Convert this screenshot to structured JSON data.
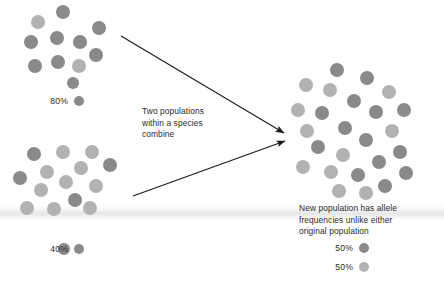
{
  "diagram": {
    "title": "Two populations within a species combine",
    "center_text": "Two populations\nwithin a species\ncombine",
    "result_text": "New population has allele\nfrequencies unlike either\noriginal population",
    "colors": {
      "dark_allele": "#8a8a8a",
      "light_allele": "#b2b2b2",
      "text": "#2b2b2b",
      "arrow": "#1a1a1a",
      "background": "#ffffff"
    },
    "populations": [
      {
        "id": "population-one",
        "legend": {
          "percent": "80%",
          "swatch": "dark"
        },
        "dots": [
          {
            "x": 38,
            "y": 22,
            "r": 7,
            "shade": "light"
          },
          {
            "x": 63,
            "y": 12,
            "r": 7,
            "shade": "dark"
          },
          {
            "x": 31,
            "y": 42,
            "r": 7,
            "shade": "dark"
          },
          {
            "x": 57,
            "y": 38,
            "r": 7,
            "shade": "dark"
          },
          {
            "x": 80,
            "y": 42,
            "r": 7,
            "shade": "dark"
          },
          {
            "x": 99,
            "y": 28,
            "r": 7,
            "shade": "dark"
          },
          {
            "x": 96,
            "y": 55,
            "r": 7,
            "shade": "dark"
          },
          {
            "x": 35,
            "y": 66,
            "r": 7,
            "shade": "dark"
          },
          {
            "x": 58,
            "y": 62,
            "r": 7,
            "shade": "dark"
          },
          {
            "x": 79,
            "y": 66,
            "r": 7,
            "shade": "light"
          },
          {
            "x": 73,
            "y": 83,
            "r": 6,
            "shade": "dark"
          }
        ]
      },
      {
        "id": "population-two",
        "legend": {
          "percent": "40%",
          "swatch": "dark"
        },
        "dots": [
          {
            "x": 34,
            "y": 154,
            "r": 7,
            "shade": "dark"
          },
          {
            "x": 63,
            "y": 152,
            "r": 7,
            "shade": "light"
          },
          {
            "x": 92,
            "y": 152,
            "r": 7,
            "shade": "light"
          },
          {
            "x": 47,
            "y": 172,
            "r": 7,
            "shade": "light"
          },
          {
            "x": 81,
            "y": 168,
            "r": 7,
            "shade": "light"
          },
          {
            "x": 110,
            "y": 165,
            "r": 7,
            "shade": "dark"
          },
          {
            "x": 20,
            "y": 178,
            "r": 7,
            "shade": "dark"
          },
          {
            "x": 66,
            "y": 182,
            "r": 7,
            "shade": "light"
          },
          {
            "x": 41,
            "y": 190,
            "r": 7,
            "shade": "light"
          },
          {
            "x": 96,
            "y": 186,
            "r": 7,
            "shade": "light"
          },
          {
            "x": 75,
            "y": 200,
            "r": 7,
            "shade": "dark"
          },
          {
            "x": 27,
            "y": 208,
            "r": 7,
            "shade": "light"
          },
          {
            "x": 54,
            "y": 209,
            "r": 7,
            "shade": "light"
          },
          {
            "x": 90,
            "y": 208,
            "r": 7,
            "shade": "light"
          },
          {
            "x": 64,
            "y": 249,
            "r": 6,
            "shade": "dark"
          }
        ]
      }
    ],
    "result_population": {
      "id": "merged-population",
      "legend": [
        {
          "percent": "50%",
          "swatch": "dark"
        },
        {
          "percent": "50%",
          "swatch": "light"
        }
      ],
      "dots": [
        {
          "x": 337,
          "y": 70,
          "r": 7,
          "shade": "dark"
        },
        {
          "x": 306,
          "y": 85,
          "r": 7,
          "shade": "light"
        },
        {
          "x": 330,
          "y": 90,
          "r": 7,
          "shade": "light"
        },
        {
          "x": 367,
          "y": 78,
          "r": 7,
          "shade": "dark"
        },
        {
          "x": 389,
          "y": 92,
          "r": 7,
          "shade": "light"
        },
        {
          "x": 354,
          "y": 101,
          "r": 7,
          "shade": "dark"
        },
        {
          "x": 298,
          "y": 110,
          "r": 7,
          "shade": "light"
        },
        {
          "x": 322,
          "y": 113,
          "r": 7,
          "shade": "dark"
        },
        {
          "x": 376,
          "y": 112,
          "r": 7,
          "shade": "dark"
        },
        {
          "x": 404,
          "y": 110,
          "r": 7,
          "shade": "dark"
        },
        {
          "x": 345,
          "y": 128,
          "r": 7,
          "shade": "dark"
        },
        {
          "x": 307,
          "y": 131,
          "r": 7,
          "shade": "light"
        },
        {
          "x": 392,
          "y": 131,
          "r": 7,
          "shade": "light"
        },
        {
          "x": 366,
          "y": 140,
          "r": 7,
          "shade": "dark"
        },
        {
          "x": 318,
          "y": 147,
          "r": 7,
          "shade": "dark"
        },
        {
          "x": 400,
          "y": 152,
          "r": 7,
          "shade": "dark"
        },
        {
          "x": 343,
          "y": 155,
          "r": 7,
          "shade": "light"
        },
        {
          "x": 379,
          "y": 162,
          "r": 7,
          "shade": "dark"
        },
        {
          "x": 303,
          "y": 167,
          "r": 7,
          "shade": "light"
        },
        {
          "x": 331,
          "y": 172,
          "r": 7,
          "shade": "light"
        },
        {
          "x": 358,
          "y": 175,
          "r": 7,
          "shade": "dark"
        },
        {
          "x": 406,
          "y": 173,
          "r": 7,
          "shade": "dark"
        },
        {
          "x": 385,
          "y": 186,
          "r": 7,
          "shade": "dark"
        },
        {
          "x": 339,
          "y": 191,
          "r": 7,
          "shade": "light"
        },
        {
          "x": 366,
          "y": 193,
          "r": 7,
          "shade": "light"
        }
      ]
    },
    "arrows": [
      {
        "id": "arrow-population-one",
        "x1": 121,
        "y1": 36,
        "x2": 284,
        "y2": 133
      },
      {
        "id": "arrow-population-two",
        "x1": 133,
        "y1": 196,
        "x2": 285,
        "y2": 141
      }
    ]
  }
}
